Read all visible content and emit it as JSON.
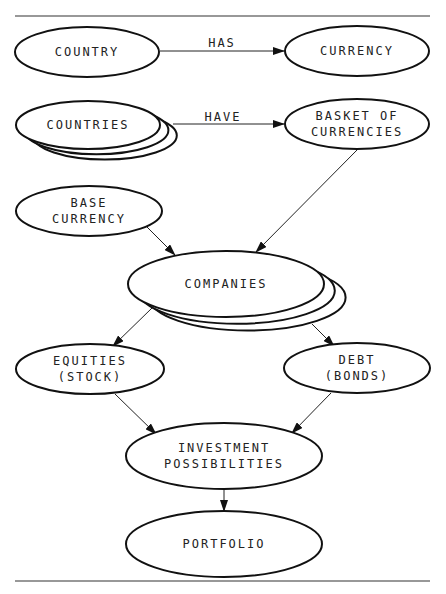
{
  "diagram": {
    "title_fragment": "",
    "nodes": [
      {
        "id": "country",
        "lines": [
          "COUNTRY"
        ],
        "cx": 87,
        "cy": 52,
        "rx": 72,
        "ry": 25,
        "stacked": 0
      },
      {
        "id": "currency",
        "lines": [
          "CURRENCY"
        ],
        "cx": 357,
        "cy": 51,
        "rx": 72,
        "ry": 25,
        "stacked": 0
      },
      {
        "id": "countries",
        "lines": [
          "COUNTRIES"
        ],
        "cx": 88,
        "cy": 125,
        "rx": 72,
        "ry": 24,
        "stacked": 2
      },
      {
        "id": "basket-of-currencies",
        "lines": [
          "BASKET OF",
          "CURRENCIES"
        ],
        "cx": 357,
        "cy": 124,
        "rx": 72,
        "ry": 25,
        "stacked": 0
      },
      {
        "id": "base-currency",
        "lines": [
          "BASE",
          "CURRENCY"
        ],
        "cx": 89,
        "cy": 211,
        "rx": 73,
        "ry": 25,
        "stacked": 0
      },
      {
        "id": "companies",
        "lines": [
          "COMPANIES"
        ],
        "cx": 226,
        "cy": 284,
        "rx": 98,
        "ry": 33,
        "stacked": 2
      },
      {
        "id": "equities",
        "lines": [
          "EQUITIES",
          "(STOCK)"
        ],
        "cx": 90,
        "cy": 369,
        "rx": 74,
        "ry": 25,
        "stacked": 0
      },
      {
        "id": "debt",
        "lines": [
          "DEBT",
          "(BONDS)"
        ],
        "cx": 357,
        "cy": 368,
        "rx": 73,
        "ry": 25,
        "stacked": 0
      },
      {
        "id": "investment-possibilities",
        "lines": [
          "INVESTMENT",
          "POSSIBILITIES"
        ],
        "cx": 224,
        "cy": 456,
        "rx": 98,
        "ry": 33,
        "stacked": 0
      },
      {
        "id": "portfolio",
        "lines": [
          "PORTFOLIO"
        ],
        "cx": 224,
        "cy": 544,
        "rx": 98,
        "ry": 33,
        "stacked": 0
      }
    ],
    "edges": [
      {
        "from": "country",
        "to": "currency",
        "label": "HAS",
        "x1": 160,
        "y1": 51,
        "x2": 284,
        "y2": 51,
        "lx": 222,
        "ly": 47
      },
      {
        "from": "countries",
        "to": "basket-of-currencies",
        "label": "HAVE",
        "x1": 173,
        "y1": 124,
        "x2": 284,
        "y2": 124,
        "lx": 223,
        "ly": 121
      },
      {
        "from": "basket-of-currencies",
        "to": "companies",
        "label": "",
        "x1": 358,
        "y1": 149,
        "x2": 256,
        "y2": 252
      },
      {
        "from": "base-currency",
        "to": "companies",
        "label": "",
        "x1": 146,
        "y1": 226,
        "x2": 175,
        "y2": 255
      },
      {
        "from": "companies",
        "to": "equities",
        "label": "",
        "x1": 152,
        "y1": 308,
        "x2": 113,
        "y2": 346
      },
      {
        "from": "companies",
        "to": "debt",
        "label": "",
        "x1": 312,
        "y1": 324,
        "x2": 334,
        "y2": 346
      },
      {
        "from": "equities",
        "to": "investment-possibilities",
        "label": "",
        "x1": 115,
        "y1": 394,
        "x2": 156,
        "y2": 434
      },
      {
        "from": "debt",
        "to": "investment-possibilities",
        "label": "",
        "x1": 331,
        "y1": 393,
        "x2": 292,
        "y2": 433
      },
      {
        "from": "investment-possibilities",
        "to": "portfolio",
        "label": "",
        "x1": 224,
        "y1": 489,
        "x2": 224,
        "y2": 511
      }
    ],
    "rules": {
      "top_y": 16,
      "bottom_y": 581,
      "x1": 15,
      "x2": 430
    },
    "colors": {
      "stroke": "#111111",
      "background": "#ffffff",
      "text": "#222222"
    }
  }
}
